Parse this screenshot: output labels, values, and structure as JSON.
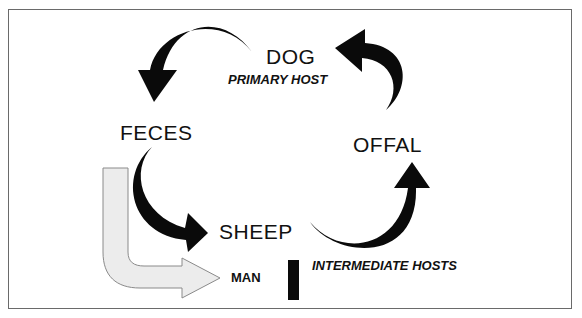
{
  "diagram": {
    "nodes": {
      "dog": "DOG",
      "primary_host": "PRIMARY HOST",
      "feces": "FECES",
      "sheep": "SHEEP",
      "offal": "OFFAL",
      "man": "MAN",
      "intermediate_hosts": "INTERMEDIATE HOSTS"
    },
    "edges": [
      {
        "from": "DOG",
        "to": "FECES",
        "style": "black curved arrow"
      },
      {
        "from": "FECES",
        "to": "SHEEP",
        "style": "black curved arrow"
      },
      {
        "from": "SHEEP",
        "to": "OFFAL",
        "style": "black curved arrow"
      },
      {
        "from": "OFFAL",
        "to": "DOG",
        "style": "black curved arrow"
      },
      {
        "from": "FECES",
        "to": "MAN",
        "style": "outlined grey L-shaped arrow"
      }
    ],
    "colors": {
      "arrow": "#0a0a0a",
      "man_arrow_fill": "#ececec",
      "man_arrow_stroke": "#8a8a8a",
      "border": "#6a6a6a"
    }
  }
}
